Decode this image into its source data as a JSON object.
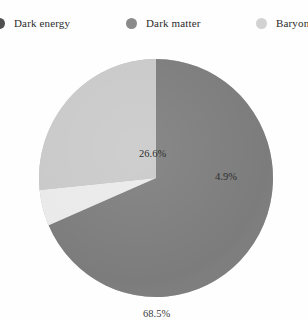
{
  "chart_data": {
    "type": "pie",
    "title": "",
    "categories": [
      "Dark energy",
      "Dark matter",
      "Baryons"
    ],
    "values": [
      68.5,
      26.6,
      4.9
    ],
    "value_labels": [
      "68.5%",
      "26.6%",
      "4.9%"
    ],
    "colors": [
      "#7c7c7c",
      "#c9c9c9",
      "#eaeaea"
    ],
    "legend_position": "top",
    "grid": false,
    "start_angle_deg": 0,
    "direction": "clockwise",
    "slices": [
      {
        "name": "Dark energy",
        "value": 68.5,
        "label": "68.5%",
        "color": "#7c7c7c",
        "legend_marker_color": "#4f4f4f"
      },
      {
        "name": "Baryons",
        "value": 4.9,
        "label": "4.9%",
        "color": "#eaeaea",
        "legend_marker_color": "#d2d2d2"
      },
      {
        "name": "Dark matter",
        "value": 26.6,
        "label": "26.6%",
        "color": "#c9c9c9",
        "legend_marker_color": "#8a8a8a"
      }
    ]
  },
  "legend": {
    "entries": [
      {
        "label": "Dark energy",
        "color": "#4f4f4f"
      },
      {
        "label": "Dark matter",
        "color": "#8a8a8a"
      },
      {
        "label": "Baryons",
        "color": "#d2d2d2"
      }
    ]
  },
  "pie": {
    "labels": [
      {
        "text": "68.5%"
      },
      {
        "text": "4.9%"
      },
      {
        "text": "26.6%"
      }
    ]
  }
}
